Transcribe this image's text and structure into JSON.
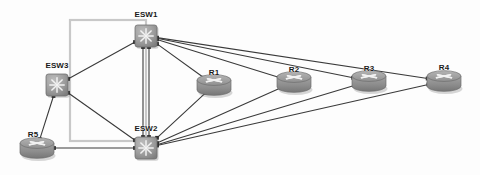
{
  "diagram": {
    "background_color": "#fdfdfd",
    "link_color": "#3a3a3a",
    "region_border_color": "#c8c8c8",
    "switch_color": "#9a9a9a",
    "router_color": "#9a9a9a",
    "region": {
      "name": "vlan-region",
      "x": 70,
      "y": 20,
      "width": 76,
      "height": 121
    },
    "nodes": [
      {
        "id": "ESW1",
        "label": "ESW1",
        "type": "switch",
        "x": 146,
        "y": 36,
        "label_x": 146,
        "label_y": 10
      },
      {
        "id": "ESW2",
        "label": "ESW2",
        "type": "switch",
        "x": 146,
        "y": 148,
        "label_x": 146,
        "label_y": 124
      },
      {
        "id": "ESW3",
        "label": "ESW3",
        "type": "switch",
        "x": 57,
        "y": 85,
        "label_x": 57,
        "label_y": 61
      },
      {
        "id": "R1",
        "label": "R1",
        "type": "router",
        "x": 214,
        "y": 85,
        "label_x": 214,
        "label_y": 68
      },
      {
        "id": "R2",
        "label": "R2",
        "type": "router",
        "x": 294,
        "y": 82,
        "label_x": 294,
        "label_y": 65
      },
      {
        "id": "R3",
        "label": "R3",
        "type": "router",
        "x": 369,
        "y": 81,
        "label_x": 369,
        "label_y": 64
      },
      {
        "id": "R4",
        "label": "R4",
        "type": "router",
        "x": 444,
        "y": 81,
        "label_x": 444,
        "label_y": 63
      },
      {
        "id": "R5",
        "label": "R5",
        "type": "router",
        "x": 37,
        "y": 148,
        "label_x": 33,
        "label_y": 130
      }
    ],
    "links": [
      {
        "from": "ESW3",
        "to": "ESW1"
      },
      {
        "from": "ESW3",
        "to": "ESW2"
      },
      {
        "from": "ESW3",
        "to": "R5"
      },
      {
        "from": "ESW1",
        "to": "ESW2"
      },
      {
        "from": "ESW1",
        "to": "ESW2"
      },
      {
        "from": "ESW2",
        "to": "R5"
      },
      {
        "from": "ESW1",
        "to": "R1"
      },
      {
        "from": "ESW1",
        "to": "R2"
      },
      {
        "from": "ESW1",
        "to": "R3"
      },
      {
        "from": "ESW1",
        "to": "R4"
      },
      {
        "from": "ESW2",
        "to": "R1"
      },
      {
        "from": "ESW2",
        "to": "R2"
      },
      {
        "from": "ESW2",
        "to": "R3"
      },
      {
        "from": "ESW2",
        "to": "R4"
      }
    ]
  }
}
